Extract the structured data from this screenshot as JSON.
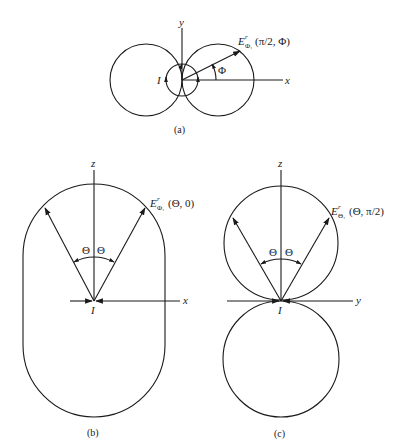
{
  "figures": {
    "a": {
      "caption": "(a)",
      "axis_x": "x",
      "axis_y": "y",
      "current_label": "I",
      "angle_label": "Φ",
      "field_label_main": "E",
      "field_label_sup": "r",
      "field_label_sub": "Φ₁",
      "field_label_args": "(π/2, Φ)"
    },
    "b": {
      "caption": "(b)",
      "axis_x": "x",
      "axis_z": "z",
      "current_label": "I",
      "angle_left": "Θ",
      "angle_right": "Θ",
      "field_label_main": "E",
      "field_label_sup": "r",
      "field_label_sub": "Φ₁",
      "field_label_args": "(Θ, 0)"
    },
    "c": {
      "caption": "(c)",
      "axis_y": "y",
      "axis_z": "z",
      "current_label": "I",
      "angle_left": "Θ",
      "angle_right": "Θ",
      "field_label_main": "E",
      "field_label_sup": "r",
      "field_label_sub": "Θ₁",
      "field_label_args": "(Θ, π/2)"
    }
  },
  "colors": {
    "stroke": "#1a1a1a",
    "background": "#ffffff"
  }
}
